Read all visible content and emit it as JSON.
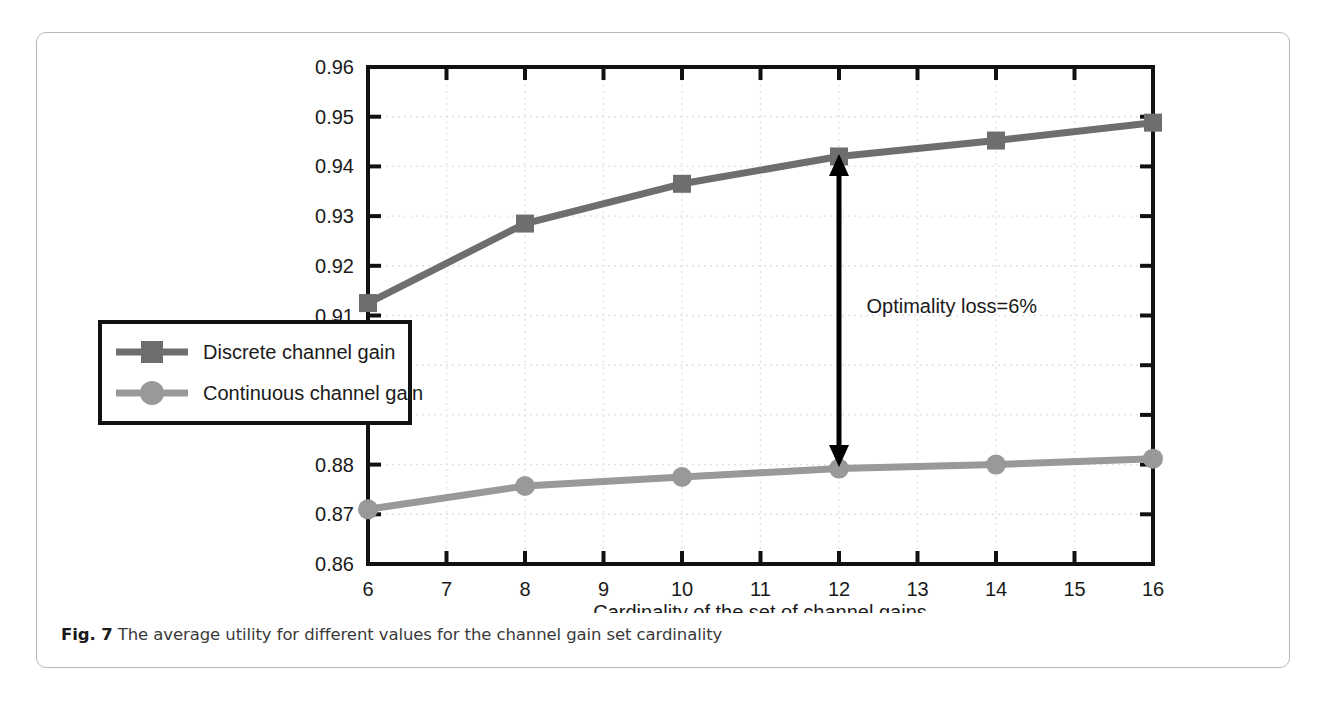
{
  "figure": {
    "caption_label": "Fig. 7",
    "caption_text": " The average utility for different values for the channel gain set cardinality"
  },
  "chart_data": {
    "type": "line",
    "title": "",
    "xlabel": "Cardinality of the set of channel gains",
    "ylabel": "u",
    "ylabel_sub": "i",
    "x": [
      6,
      8,
      10,
      12,
      14,
      16
    ],
    "xlim": [
      6,
      16
    ],
    "ylim": [
      0.86,
      0.96
    ],
    "xticks": [
      "6",
      "7",
      "8",
      "9",
      "10",
      "11",
      "12",
      "13",
      "14",
      "15",
      "16"
    ],
    "xtick_values": [
      6,
      7,
      8,
      9,
      10,
      11,
      12,
      13,
      14,
      15,
      16
    ],
    "yticks": [
      "0.86",
      "0.87",
      "0.88",
      "0.89",
      "0.9",
      "0.91",
      "0.92",
      "0.93",
      "0.94",
      "0.95",
      "0.96"
    ],
    "ytick_values": [
      0.86,
      0.87,
      0.88,
      0.89,
      0.9,
      0.91,
      0.92,
      0.93,
      0.94,
      0.95,
      0.96
    ],
    "grid": true,
    "legend_position": "center-left",
    "series": [
      {
        "name": "Discrete channel gain",
        "marker": "square",
        "color": "#6e6e6e",
        "values": [
          0.9125,
          0.9285,
          0.9365,
          0.942,
          0.9452,
          0.9488
        ]
      },
      {
        "name": "Continuous channel gain",
        "marker": "circle",
        "color": "#999999",
        "values": [
          0.871,
          0.8757,
          0.8775,
          0.8792,
          0.88,
          0.8812
        ]
      }
    ],
    "annotations": [
      {
        "text": "Optimality loss=6%",
        "type": "double-arrow",
        "x": 12,
        "y_from": 0.8795,
        "y_to": 0.9425,
        "label_x": 12.35,
        "label_y": 0.9105
      }
    ]
  },
  "colors": {
    "discrete": "#6e6e6e",
    "continuous": "#999999",
    "axis": "#111111",
    "grid": "#e2e2e2",
    "card_border": "#b8b8b8",
    "caption": "#3a3a3a"
  }
}
